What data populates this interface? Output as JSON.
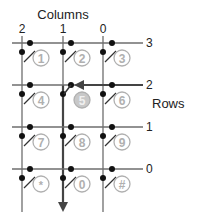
{
  "title": "Columns",
  "rows_label": "Rows",
  "columns": [
    {
      "label": "2",
      "x": 22
    },
    {
      "label": "1",
      "x": 63
    },
    {
      "label": "0",
      "x": 103
    }
  ],
  "rows": [
    {
      "label": "3",
      "y": 43
    },
    {
      "label": "2",
      "y": 85
    },
    {
      "label": "1",
      "y": 127
    },
    {
      "label": "0",
      "y": 169
    }
  ],
  "keys": [
    [
      "1",
      "2",
      "3"
    ],
    [
      "4",
      "5",
      "6"
    ],
    [
      "7",
      "8",
      "9"
    ],
    [
      "*",
      "0",
      "#"
    ]
  ],
  "pressed_key": "5",
  "active_column": "1",
  "active_row": "2",
  "colors": {
    "line": "#6e6e6e",
    "active_line": "#444444",
    "dot": "#111111",
    "key_outline": "#b0b0b0",
    "key_text": "#b0b0b0",
    "pressed_fill": "#c8c8c8",
    "text": "#222222"
  }
}
